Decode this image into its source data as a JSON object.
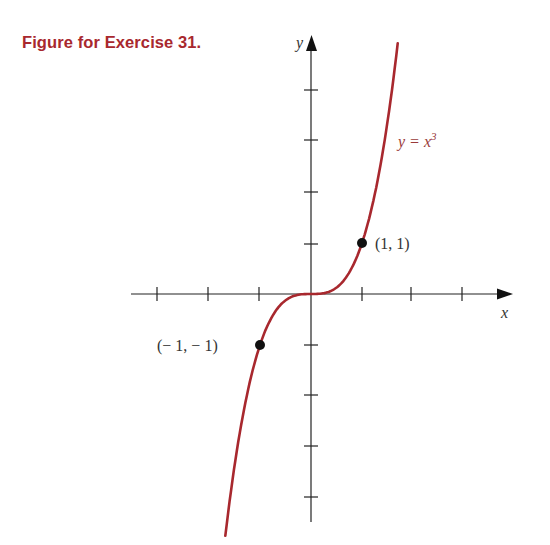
{
  "figure": {
    "title": "Figure for Exercise 31."
  },
  "chart_data": {
    "type": "line",
    "title": "Figure for Exercise 31.",
    "xlabel": "x",
    "ylabel": "y",
    "series": [
      {
        "name": "y = x^3",
        "label": "y = x³",
        "function": "x^3",
        "x": [
          -1.68,
          -1.5,
          -1.25,
          -1,
          -0.75,
          -0.5,
          -0.25,
          0,
          0.25,
          0.5,
          0.75,
          1,
          1.25,
          1.5,
          1.7
        ],
        "y": [
          -4.74,
          -3.375,
          -1.953,
          -1,
          -0.422,
          -0.125,
          -0.016,
          0,
          0.016,
          0.125,
          0.422,
          1,
          1.953,
          3.375,
          4.913
        ],
        "color": "#a8282e"
      }
    ],
    "points": [
      {
        "x": 1,
        "y": 1,
        "label": "(1, 1)"
      },
      {
        "x": -1,
        "y": -1,
        "label": "(− 1, − 1)"
      }
    ],
    "xticks": [
      -3,
      -2,
      -1,
      1,
      2,
      3
    ],
    "yticks": [
      -4,
      -3,
      -2,
      -1,
      1,
      2,
      3,
      4
    ],
    "xlim": [
      -3.5,
      4
    ],
    "ylim": [
      -4.5,
      5.1
    ],
    "grid": false,
    "legend": "none",
    "tick_labels_shown": false
  },
  "labels": {
    "x_axis": "x",
    "y_axis": "y",
    "curve": "y = x",
    "curve_exp": "3",
    "point_pos": "(1, 1)",
    "point_neg": "(− 1, − 1)"
  }
}
